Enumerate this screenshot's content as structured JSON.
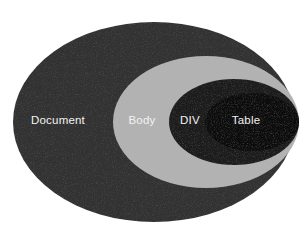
{
  "diagram": {
    "type": "nested-ellipse-containment",
    "canvas": {
      "width": 307,
      "height": 232,
      "background": "#ffffff"
    },
    "levels": [
      {
        "id": "document",
        "label": "Document",
        "depth": 0,
        "fill": "#333333",
        "label_color": "#f2f2f2",
        "cx": 154,
        "cy": 122,
        "rx": 141,
        "ry": 100,
        "label_x": 58,
        "label_y": 121
      },
      {
        "id": "body",
        "label": "Body",
        "depth": 1,
        "fill": "#b2b2b2",
        "label_color": "#f7f7f7",
        "cx": 206,
        "cy": 122,
        "rx": 93,
        "ry": 66,
        "label_x": 142,
        "label_y": 121
      },
      {
        "id": "div",
        "label": "DIV",
        "depth": 2,
        "fill": "#1c1c1c",
        "label_color": "#f2f2f2",
        "cx": 234,
        "cy": 122,
        "rx": 65,
        "ry": 43,
        "label_x": 190,
        "label_y": 121
      },
      {
        "id": "table",
        "label": "Table",
        "depth": 3,
        "fill": "#0b0b0b",
        "label_color": "#ececec",
        "cx": 252,
        "cy": 122,
        "rx": 47,
        "ry": 29,
        "label_x": 246,
        "label_y": 121
      }
    ],
    "colors": {
      "outer_fill": "#333333",
      "body_fill": "#b2b2b2",
      "div_fill": "#1c1c1c",
      "table_fill": "#0b0b0b",
      "label_text": "#f2f2f2",
      "background": "#ffffff"
    }
  }
}
